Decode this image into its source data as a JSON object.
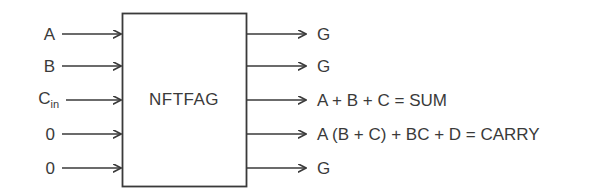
{
  "diagram": {
    "type": "block-diagram",
    "block": {
      "label": "NFTFAG",
      "x": 122,
      "y": 13,
      "width": 125,
      "height": 174,
      "border_color": "#3a3a3a",
      "fill_color": "#ffffff"
    },
    "line_color": "#3a3a3a",
    "text_color": "#3a3a3a",
    "background_color": "#ffffff",
    "inputs": [
      {
        "label": "A",
        "sub": "",
        "y": 34
      },
      {
        "label": "B",
        "sub": "",
        "y": 66
      },
      {
        "label": "C",
        "sub": "in",
        "y": 100
      },
      {
        "label": "0",
        "sub": "",
        "y": 134
      },
      {
        "label": "0",
        "sub": "",
        "y": 168
      }
    ],
    "outputs": [
      {
        "label": "G",
        "y": 34
      },
      {
        "label": "G",
        "y": 66
      },
      {
        "label": "A + B + C = SUM",
        "y": 100
      },
      {
        "label": "A (B + C) + BC + D = CARRY",
        "y": 134
      },
      {
        "label": "G",
        "y": 168
      }
    ]
  }
}
